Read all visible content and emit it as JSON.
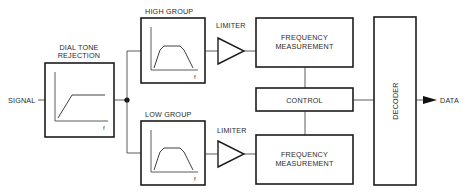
{
  "diagram": {
    "input_label": "SIGNAL",
    "output_label": "DATA",
    "blocks": {
      "dial_tone": {
        "label_line1": "DIAL TONE",
        "label_line2": "REJECTION",
        "axis_label": "f",
        "response": "high-pass"
      },
      "high_group": {
        "label": "HIGH GROUP",
        "axis_label": "f",
        "response": "band-pass"
      },
      "low_group": {
        "label": "LOW GROUP",
        "axis_label": "f",
        "response": "band-pass"
      },
      "limiter_high": {
        "label": "LIMITER"
      },
      "limiter_low": {
        "label": "LIMITER"
      },
      "freq_high": {
        "label_line1": "FREQUENCY",
        "label_line2": "MEASUREMENT"
      },
      "control": {
        "label": "CONTROL"
      },
      "freq_low": {
        "label_line1": "FREQUENCY",
        "label_line2": "MEASUREMENT"
      },
      "decoder": {
        "label": "DECODER"
      }
    }
  }
}
